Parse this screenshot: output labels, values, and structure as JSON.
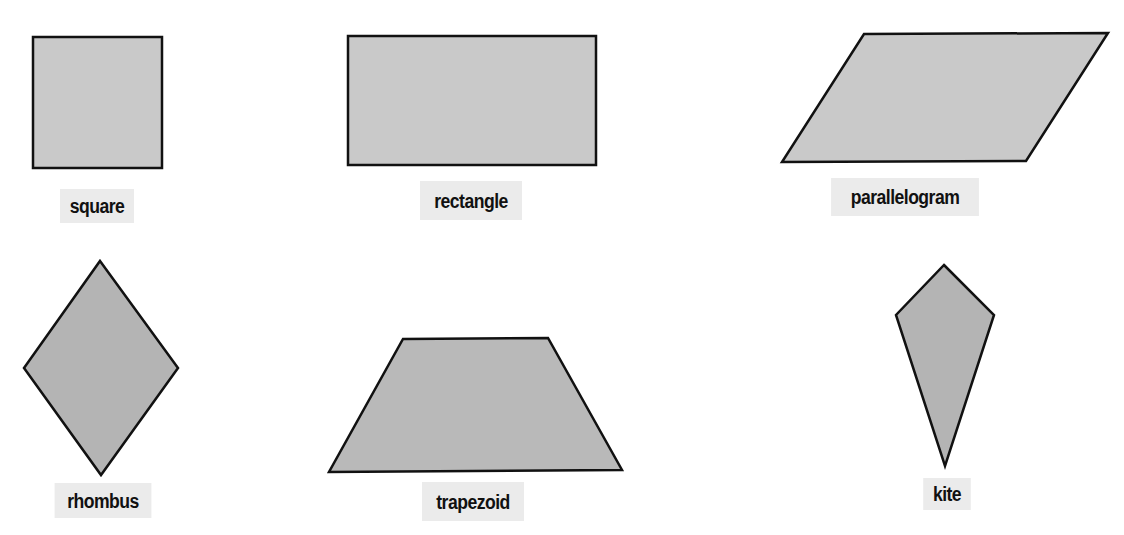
{
  "diagram": {
    "shapes": [
      {
        "id": "square",
        "label": "square",
        "points": "33,37 162,37 162,168 33,168",
        "fill": "#c9c9c9"
      },
      {
        "id": "rectangle",
        "label": "rectangle",
        "points": "348,36 596,36 596,165 348,165",
        "fill": "#c9c9c9"
      },
      {
        "id": "parallelogram",
        "label": "parallelogram",
        "points": "864,34 1108,33 1026,161 782,162",
        "fill": "#c9c9c9"
      },
      {
        "id": "rhombus",
        "label": "rhombus",
        "points": "100,261 178,368 101,475 24,368",
        "fill": "#b4b4b4"
      },
      {
        "id": "trapezoid",
        "label": "trapezoid",
        "points": "403,339 548,338 622,470 329,472",
        "fill": "#b9b9b9"
      },
      {
        "id": "kite",
        "label": "kite",
        "points": "944,265 994,315 945,466 896,315",
        "fill": "#b4b4b4"
      }
    ],
    "stroke_color": "#111111",
    "label_background": "#ebebeb"
  }
}
